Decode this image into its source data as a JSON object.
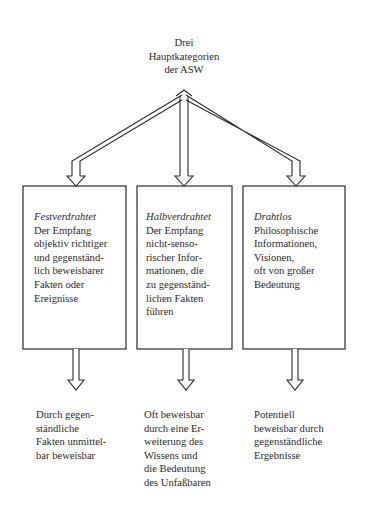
{
  "title": {
    "lines": [
      "Drei",
      "Hauptkategorien",
      "der ASW"
    ]
  },
  "boxes": [
    {
      "category": "Festverdrahtet",
      "lines": [
        "Der Empfang",
        "objektiv richtiger",
        "und gegenständ-",
        "lich beweisbarer",
        "Fakten oder",
        "Ereignisse"
      ]
    },
    {
      "category": "Halbverdrahtet",
      "lines": [
        "Der Empfang",
        "nicht-senso-",
        "rischer Infor-",
        "mationen, die",
        "zu gegenständ-",
        "lichen Fakten",
        "führen"
      ]
    },
    {
      "category": "Drahtlos",
      "lines": [
        "Philosophische",
        "Informationen,",
        "Visionen,",
        "oft von großer",
        "Bedeutung"
      ]
    }
  ],
  "outcomes": [
    {
      "lines": [
        "Durch gegen-",
        "ständliche",
        "Fakten unmittel-",
        "bar beweisbar"
      ]
    },
    {
      "lines": [
        "Oft beweisbar",
        "durch eine Er-",
        "weiterung des",
        "Wissens und",
        "die Bedeutung",
        "des Unfaßbaren"
      ]
    },
    {
      "lines": [
        "Potentiell",
        "beweisbar durch",
        "gegenständliche",
        "Ergebnisse"
      ]
    }
  ],
  "colors": {
    "stroke": "#2a2a2a",
    "background": "#ffffff"
  }
}
